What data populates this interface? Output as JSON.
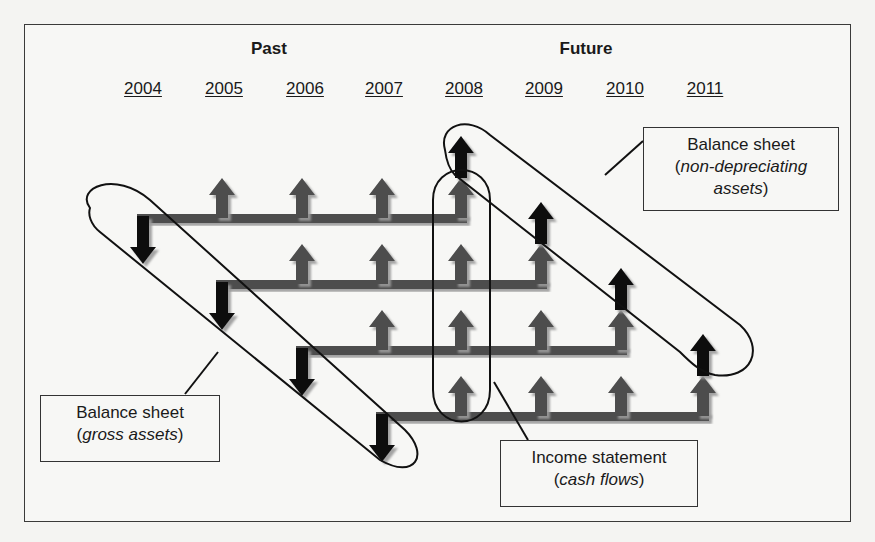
{
  "header": {
    "past_label": "Past",
    "future_label": "Future"
  },
  "years": [
    "2004",
    "2005",
    "2006",
    "2007",
    "2008",
    "2009",
    "2010",
    "2011"
  ],
  "callouts": {
    "non_depreciating": {
      "title": "Balance sheet",
      "open_paren": "(",
      "italic_1": "non-depreciating",
      "italic_2": "assets",
      "close_paren": ")"
    },
    "gross_assets": {
      "title": "Balance sheet",
      "open_paren": "(",
      "italic": "gross assets",
      "close_paren": ")"
    },
    "income_statement": {
      "title": "Income statement",
      "open_paren": "(",
      "italic": "cash flows",
      "close_paren": ")"
    }
  },
  "colors": {
    "grey_arrow": "#4d4d4d",
    "black_arrow": "#111111",
    "outline": "#111111",
    "frame": "#3a3a3a",
    "background": "#f7f7f5"
  },
  "rows": [
    {
      "start_year": "2004",
      "cash_flow_years": [
        "2005",
        "2006",
        "2007",
        "2008"
      ],
      "end_year": "2008"
    },
    {
      "start_year": "2005",
      "cash_flow_years": [
        "2006",
        "2007",
        "2008",
        "2009"
      ],
      "end_year": "2009"
    },
    {
      "start_year": "2006",
      "cash_flow_years": [
        "2007",
        "2008",
        "2009",
        "2010"
      ],
      "end_year": "2010"
    },
    {
      "start_year": "2007",
      "cash_flow_years": [
        "2008",
        "2009",
        "2010",
        "2011"
      ],
      "end_year": "2011"
    }
  ]
}
